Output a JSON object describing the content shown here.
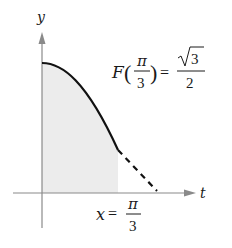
{
  "figure": {
    "axes": {
      "x_label": "t",
      "y_label": "y",
      "axis_color": "#8a8a8a"
    },
    "curve": {
      "color": "#111111",
      "solid_segment": "from t=0 to t=π/3",
      "dashed_segment": "beyond t=π/3 to the t-axis"
    },
    "shaded_region": {
      "fill": "#ececec",
      "from": "0",
      "to": "π/3"
    },
    "annotations": {
      "function_value": {
        "func": "F",
        "arg_numerator": "π",
        "arg_denominator": "3",
        "equals": "=",
        "value_radical": "3",
        "value_denominator": "2",
        "text": "F(π/3) = √3/2"
      },
      "bound_label": {
        "var": "x",
        "equals": "=",
        "numerator": "π",
        "denominator": "3",
        "text": "x = π/3"
      }
    }
  }
}
